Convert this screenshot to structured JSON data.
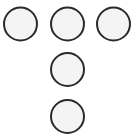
{
  "diagram": {
    "canvas": {
      "width": 133,
      "height": 140,
      "background": "#ffffff"
    },
    "style": {
      "fill": "#f4f4f4",
      "stroke": "#2a2a2a",
      "stroke_width": 2
    },
    "circles": [
      {
        "id": "circle-top-left",
        "cx": 20.5,
        "cy": 24,
        "r": 16.5
      },
      {
        "id": "circle-top-middle",
        "cx": 67.5,
        "cy": 24,
        "r": 16.5
      },
      {
        "id": "circle-top-right",
        "cx": 113.5,
        "cy": 24,
        "r": 16.5
      },
      {
        "id": "circle-middle",
        "cx": 67.5,
        "cy": 69.5,
        "r": 16.5
      },
      {
        "id": "circle-bottom",
        "cx": 67.5,
        "cy": 116.5,
        "r": 16.5
      }
    ]
  }
}
